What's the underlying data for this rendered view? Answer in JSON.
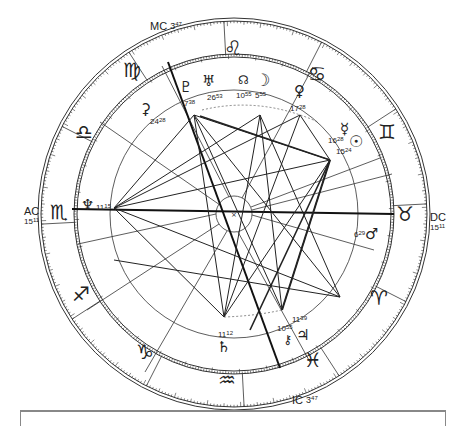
{
  "chart": {
    "type": "natal-horoscope-wheel",
    "angles": {
      "mc": {
        "label": "MC",
        "deg": "3",
        "min": "47"
      },
      "ic": {
        "label": "IC",
        "deg": "3",
        "min": "47"
      },
      "ac": {
        "label": "AC",
        "deg": "15",
        "min": "11"
      },
      "dc": {
        "label": "DC",
        "deg": "15",
        "min": "11"
      }
    },
    "signs": [
      {
        "name": "leo",
        "glyph": "♌"
      },
      {
        "name": "cancer",
        "glyph": "♋"
      },
      {
        "name": "gemini",
        "glyph": "♊"
      },
      {
        "name": "taurus",
        "glyph": "♉"
      },
      {
        "name": "aries",
        "glyph": "♈"
      },
      {
        "name": "pisces",
        "glyph": "♓"
      },
      {
        "name": "aquarius",
        "glyph": "♒"
      },
      {
        "name": "capricorn",
        "glyph": "♑"
      },
      {
        "name": "sagittarius",
        "glyph": "♐"
      },
      {
        "name": "scorpio",
        "glyph": "♏"
      },
      {
        "name": "libra",
        "glyph": "♎"
      },
      {
        "name": "virgo",
        "glyph": "♍"
      }
    ],
    "planets": [
      {
        "name": "pluto",
        "glyph": "♇",
        "deg": "7",
        "min": "38"
      },
      {
        "name": "uranus",
        "glyph": "♅",
        "deg": "26",
        "min": "53"
      },
      {
        "name": "node",
        "glyph": "☊",
        "deg": "10",
        "min": "55"
      },
      {
        "name": "moon",
        "glyph": "☽",
        "deg": "5",
        "min": "55"
      },
      {
        "name": "venus",
        "glyph": "♀",
        "deg": "17",
        "min": "28"
      },
      {
        "name": "mercury",
        "glyph": "☿",
        "deg": "16",
        "min": "28"
      },
      {
        "name": "sun",
        "glyph": "☉",
        "deg": "15",
        "min": "24"
      },
      {
        "name": "mars",
        "glyph": "♂",
        "deg": "6",
        "min": "29"
      },
      {
        "name": "neptune",
        "glyph": "♆",
        "deg": "11",
        "min": "15"
      },
      {
        "name": "ceres",
        "glyph": "⚳",
        "deg": "24",
        "min": "28"
      },
      {
        "name": "saturn",
        "glyph": "♄",
        "deg": "11",
        "min": "12"
      },
      {
        "name": "chiron",
        "glyph": "⚷",
        "deg": "10",
        "min": "55"
      },
      {
        "name": "jupiter",
        "glyph": "♃",
        "deg": "11",
        "min": "39"
      }
    ],
    "colors": {
      "line": "#222222",
      "background": "#ffffff",
      "frame": "#888888"
    }
  }
}
